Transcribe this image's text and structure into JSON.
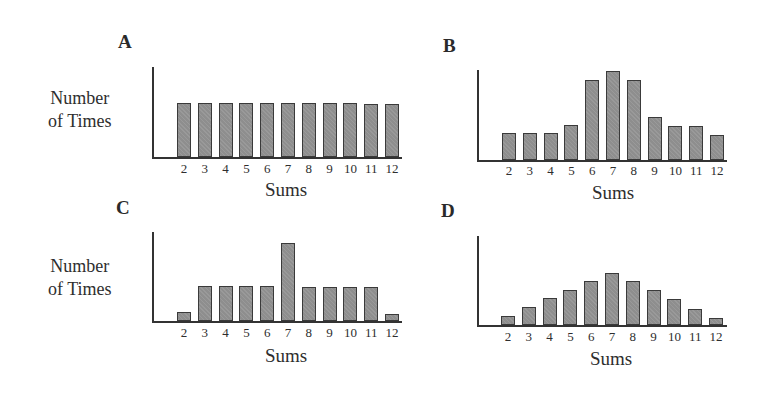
{
  "figure": {
    "ylabel_line1": "Number",
    "ylabel_line2": "of Times",
    "xlabel": "Sums",
    "bar_color": "#8e8e8e",
    "axis_color": "#333333"
  },
  "chart_data": [
    {
      "type": "bar",
      "title": "A",
      "xlabel": "Sums",
      "ylabel": "Number of Times",
      "categories": [
        "2",
        "3",
        "4",
        "5",
        "6",
        "7",
        "8",
        "9",
        "10",
        "11",
        "12"
      ],
      "values": [
        54,
        54,
        54,
        54,
        54,
        54,
        54,
        54,
        54,
        53,
        53
      ],
      "ylim": [
        0,
        90
      ],
      "grid": false,
      "y_ticks_shown": false
    },
    {
      "type": "bar",
      "title": "B",
      "xlabel": "Sums",
      "ylabel": "",
      "categories": [
        "2",
        "3",
        "4",
        "5",
        "6",
        "7",
        "8",
        "9",
        "10",
        "11",
        "12"
      ],
      "values": [
        27,
        27,
        27,
        35,
        80,
        89,
        80,
        43,
        34,
        34,
        25
      ],
      "ylim": [
        0,
        90
      ],
      "grid": false,
      "y_ticks_shown": false
    },
    {
      "type": "bar",
      "title": "C",
      "xlabel": "Sums",
      "ylabel": "Number of Times",
      "categories": [
        "2",
        "3",
        "4",
        "5",
        "6",
        "7",
        "8",
        "9",
        "10",
        "11",
        "12"
      ],
      "values": [
        9,
        35,
        35,
        35,
        35,
        79,
        34,
        34,
        34,
        34,
        7
      ],
      "ylim": [
        0,
        90
      ],
      "grid": false,
      "y_ticks_shown": false
    },
    {
      "type": "bar",
      "title": "D",
      "xlabel": "Sums",
      "ylabel": "",
      "categories": [
        "2",
        "3",
        "4",
        "5",
        "6",
        "7",
        "8",
        "9",
        "10",
        "11",
        "12"
      ],
      "values": [
        9,
        18,
        27,
        35,
        44,
        53,
        44,
        35,
        26,
        16,
        7
      ],
      "ylim": [
        0,
        90
      ],
      "grid": false,
      "y_ticks_shown": false
    }
  ],
  "panels": [
    {
      "letter": "A",
      "show_ylabel": true,
      "letter_x": 118,
      "letter_y": 32,
      "ylabel_x": 48,
      "ylabel_y": 87,
      "axis_x": 152,
      "axis_top": 67,
      "baseline": 157,
      "axis_right": 402,
      "first_bar_x": 177,
      "bar_step": 20.8,
      "bar_w": 14,
      "tick_y": 162,
      "xlabel_x": 265,
      "xlabel_y": 180
    },
    {
      "letter": "B",
      "show_ylabel": false,
      "letter_x": 443,
      "letter_y": 36,
      "ylabel_x": 0,
      "ylabel_y": 0,
      "axis_x": 477,
      "axis_top": 70,
      "baseline": 160,
      "axis_right": 727,
      "first_bar_x": 502,
      "bar_step": 20.8,
      "bar_w": 14,
      "tick_y": 164,
      "xlabel_x": 592,
      "xlabel_y": 183
    },
    {
      "letter": "C",
      "show_ylabel": true,
      "letter_x": 116,
      "letter_y": 198,
      "ylabel_x": 48,
      "ylabel_y": 255,
      "axis_x": 152,
      "axis_top": 232,
      "baseline": 321,
      "axis_right": 402,
      "first_bar_x": 177,
      "bar_step": 20.8,
      "bar_w": 14,
      "tick_y": 326,
      "xlabel_x": 265,
      "xlabel_y": 346
    },
    {
      "letter": "D",
      "show_ylabel": false,
      "letter_x": 441,
      "letter_y": 201,
      "ylabel_x": 0,
      "ylabel_y": 0,
      "axis_x": 477,
      "axis_top": 236,
      "baseline": 325,
      "axis_right": 727,
      "first_bar_x": 501,
      "bar_step": 20.8,
      "bar_w": 14,
      "tick_y": 330,
      "xlabel_x": 590,
      "xlabel_y": 349
    }
  ]
}
